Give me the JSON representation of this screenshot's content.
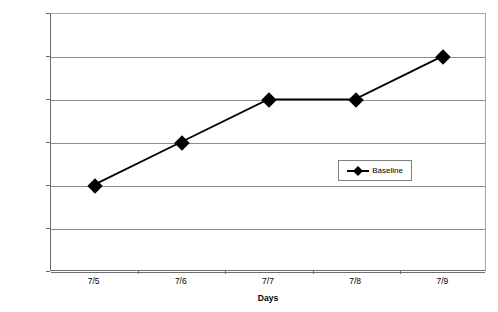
{
  "chart_data": {
    "type": "line",
    "title": "",
    "xlabel": "Days",
    "ylabel": "% of intervals in which aggression occurred",
    "categories": [
      "7/5",
      "7/6",
      "7/7",
      "7/8",
      "7/9"
    ],
    "series": [
      {
        "name": "Baseline",
        "values": [
          20,
          30,
          40,
          40,
          50
        ],
        "color": "#000000",
        "marker": "diamond"
      }
    ],
    "ylim": [
      0,
      60
    ],
    "yticks": [
      0,
      10,
      20,
      30,
      40,
      50,
      60
    ],
    "grid": "horizontal",
    "legend_position": "center-right",
    "legend_entries": [
      "Baseline"
    ]
  },
  "axes": {
    "y_title": "% of intervals in which aggression occurred",
    "x_title": "Days",
    "y_tick_labels": [
      "0",
      "10",
      "20",
      "30",
      "40",
      "50",
      "60"
    ],
    "x_tick_labels": [
      "7/5",
      "7/6",
      "7/7",
      "7/8",
      "7/9"
    ]
  },
  "legend": {
    "baseline_label": "Baseline"
  }
}
